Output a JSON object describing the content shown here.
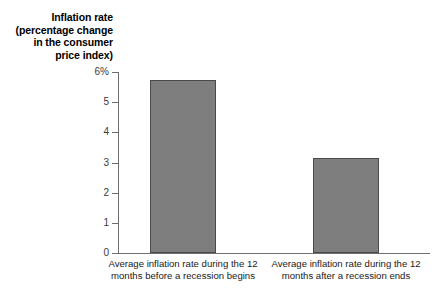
{
  "chart_data": {
    "type": "bar",
    "title": "",
    "xlabel": "",
    "ylabel": "Inflation rate (percentage change in the consumer price index)",
    "ylabel_lines": [
      "Inflation rate",
      "(percentage change",
      "in the consumer",
      "price index)"
    ],
    "categories": [
      "Average inflation rate during the 12 months before a recession begins",
      "Average inflation rate during the 12 months after a recession ends"
    ],
    "category_lines": [
      [
        "Average inflation rate during the 12",
        "months before a recession begins"
      ],
      [
        "Average inflation rate during the 12",
        "months after a recession ends"
      ]
    ],
    "values": [
      5.75,
      3.15
    ],
    "ylim": [
      0,
      6
    ],
    "yticks": [
      0,
      1,
      2,
      3,
      4,
      5,
      6
    ],
    "ytick_labels": [
      "0",
      "1",
      "2",
      "3",
      "4",
      "5",
      "6%"
    ],
    "grid": false,
    "legend": false,
    "bar_color": "#7e7e7e",
    "bar_edge_color": "#4a4a4a",
    "axis_color": "#6f6f6f"
  }
}
